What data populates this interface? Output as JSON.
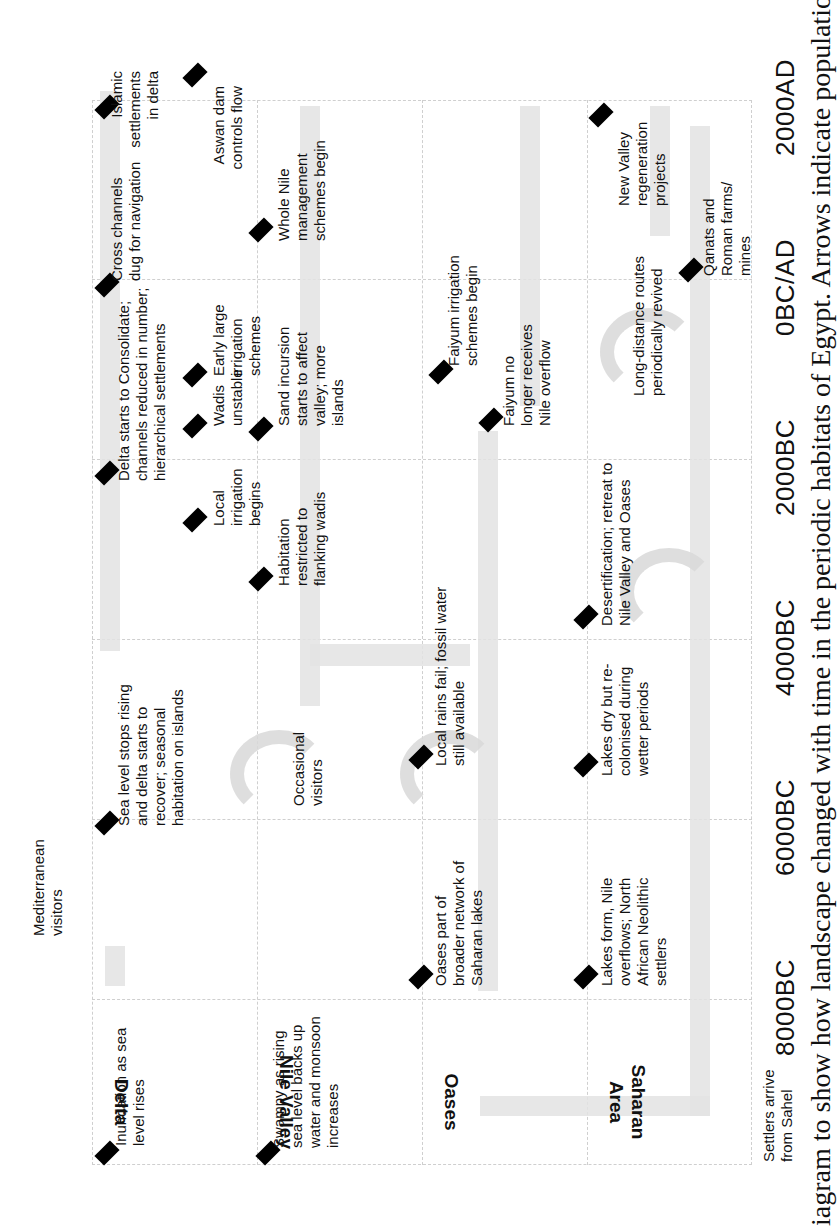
{
  "diagram": {
    "title_fragment": "",
    "caption": "iagram to show how landscape changed with time in the periodic habitats of Egypt. Arrows indicate population",
    "rows": [
      {
        "label": "Delta"
      },
      {
        "label": "Nile Valley"
      },
      {
        "label": "Oases"
      },
      {
        "label": "Saharan Area"
      }
    ],
    "time_axis": [
      "8000BC",
      "6000BC",
      "4000BC",
      "2000BC",
      "0BC/AD",
      "2000AD"
    ],
    "extra_labels": {
      "mediterranean": "Mediterranean visitors",
      "sahel": "Settlers arrive from Sahel"
    },
    "events": {
      "delta": [
        "Inundation as sea level rises",
        "Sea level stops rising and delta starts to recover; seasonal habitation on islands",
        "Delta starts to Consolidate; channels reduced in number; hierarchical settlements",
        "Cross channels dug for navigation",
        "Islamic settlements in delta"
      ],
      "nile_valley": [
        "Swampy as rising sea level backs up water and monsoon increases",
        "Occasional visitors",
        "Habitation restricted to flanking wadis",
        "Local irrigation begins",
        "Wadis unstable",
        "Sand incursion starts to affect valley; more islands",
        "Early large irrigation schemes",
        "Whole Nile management schemes begin",
        "Aswan dam controls flow"
      ],
      "oases": [
        "Oases part of broader network of Saharan lakes",
        "Local rains fail; fossil water still available",
        "Faiyum no longer receives Nile overflow",
        "Faiyum irrigation schemes begin"
      ],
      "saharan_area": [
        "Lakes form, Nile overflows; North African Neolithic settlers",
        "Lakes dry but re-colonised during wetter periods",
        "Desertification; retreat to Nile Valley and Oases",
        "Long-distance routes periodically revived",
        "Qanats and Roman farms/ mines",
        "New Valley regeneration projects"
      ]
    },
    "colors": {
      "marker": "#000000",
      "arrow": "#e0e0e0",
      "grid": "#cfcfcf"
    }
  }
}
